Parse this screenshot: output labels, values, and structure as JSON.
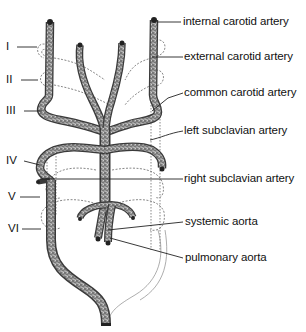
{
  "diagram": {
    "title": "",
    "arch_labels": [
      {
        "id": "I",
        "text": "I"
      },
      {
        "id": "II",
        "text": "II"
      },
      {
        "id": "III",
        "text": "III"
      },
      {
        "id": "IV",
        "text": "IV"
      },
      {
        "id": "V",
        "text": "V"
      },
      {
        "id": "VI",
        "text": "VI"
      }
    ],
    "structure_labels": [
      {
        "id": "internal-carotid",
        "text": "internal carotid artery"
      },
      {
        "id": "external-carotid",
        "text": "external carotid artery"
      },
      {
        "id": "common-carotid",
        "text": "common carotid artery"
      },
      {
        "id": "left-subclavian",
        "text": "left subclavian artery"
      },
      {
        "id": "right-subclavian",
        "text": "right subclavian artery"
      },
      {
        "id": "systemic-aorta",
        "text": "systemic aorta"
      },
      {
        "id": "pulmonary-aorta",
        "text": "pulmonary aorta"
      }
    ],
    "colors": {
      "vessel_stroke": "#3a3a3a",
      "vessel_fill": "#8c8c8c",
      "ghost_line": "#6a6a6a",
      "text": "#111111",
      "background": "#ffffff"
    }
  }
}
